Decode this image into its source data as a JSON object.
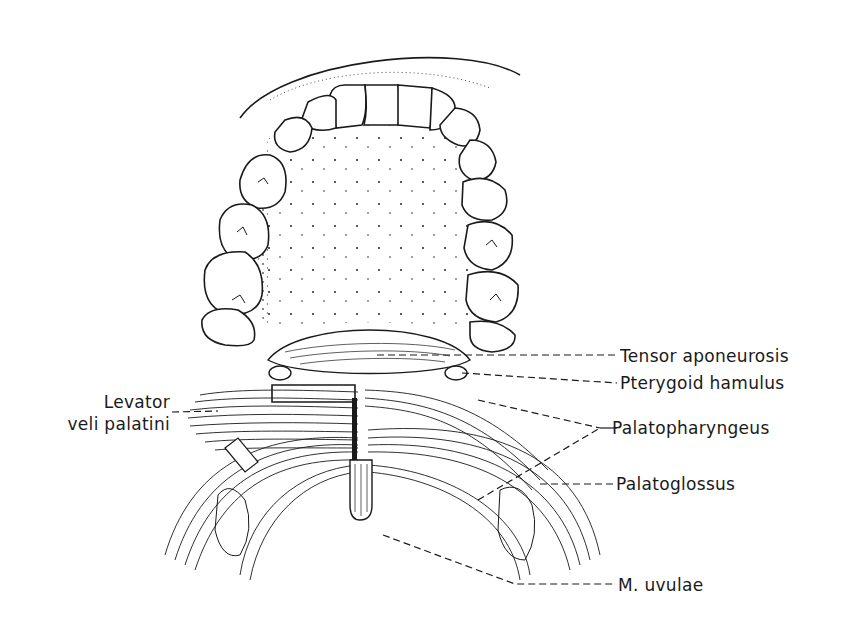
{
  "figure": {
    "labels": {
      "tensor_aponeurosis": "Tensor aponeurosis",
      "pterygoid_hamulus": "Pterygoid hamulus",
      "levator_line1": "Levator",
      "levator_line2": "veli palatini",
      "palatopharyngeus": "Palatopharyngeus",
      "palatoglossus": "Palatoglossus",
      "m_uvulae": "M. uvulae"
    },
    "colors": {
      "ink": "#1a1a1a",
      "background": "#ffffff"
    }
  }
}
